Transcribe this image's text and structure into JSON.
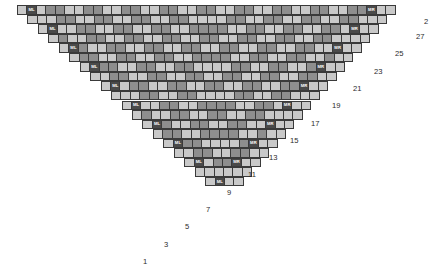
{
  "document": {
    "title": "Triangular Shawl Knitting Chart",
    "type": "grid-chart"
  },
  "legend": {
    "marker_left_label": "ML",
    "marker_right_label": "MR",
    "light_color": "#c9c9c9",
    "dark_color": "#8e8e8e",
    "marker_color": "#4a4a4a",
    "grid_line_color": "#3a3a3a",
    "text_color": "#2b2b2b"
  },
  "grid": {
    "cell_width": 10.45,
    "cell_height": 9.55,
    "rows_count": 28,
    "origin_x": 17,
    "origin_y": 5,
    "top_row_cells": 40
  },
  "row_numbers": [
    {
      "label": "2",
      "x": 418,
      "y": 53
    },
    {
      "label": "27",
      "x": 393,
      "y": 72
    },
    {
      "label": "25",
      "x": 372,
      "y": 91
    },
    {
      "label": "23",
      "x": 351,
      "y": 110
    },
    {
      "label": "21",
      "x": 330,
      "y": 129
    },
    {
      "label": "19",
      "x": 309,
      "y": 148
    },
    {
      "label": "17",
      "x": 288,
      "y": 167
    },
    {
      "label": "15",
      "x": 267,
      "y": 186
    },
    {
      "label": "13",
      "x": 246,
      "y": 205
    },
    {
      "label": "11",
      "x": 225,
      "y": 224
    },
    {
      "label": "9",
      "x": 207,
      "y": 243
    },
    {
      "label": "7",
      "x": 186,
      "y": 262
    },
    {
      "label": "5",
      "x": 165,
      "y": 281
    },
    {
      "label": "3",
      "x": 144,
      "y": 300
    },
    {
      "label": "1",
      "x": 123,
      "y": 319
    }
  ],
  "chart_data": {
    "type": "heatmap",
    "xlabel": "",
    "ylabel": "Row",
    "legend": [
      "light stitch",
      "dark stitch",
      "ML increase marker",
      "MR increase marker"
    ],
    "row_labels_right": [
      "2",
      "27",
      "25",
      "23",
      "21",
      "19",
      "17",
      "15",
      "13",
      "11",
      "9",
      "7",
      "5",
      "3",
      "1"
    ],
    "rows": [
      {
        "index": 0,
        "left": 17,
        "top": 5,
        "cells": "LMddLdLdddLdLdLdLdLdddLdLdLdLdLdLddRLL"
      },
      {
        "index": 1,
        "left": 27,
        "top": 14,
        "cells": "LLdLdLdddLdLdLdLdLdLdLdLdLdLdLdLdLL"
      },
      {
        "index": 2,
        "left": 38,
        "top": 24,
        "cells": "LMdLdLdddLdLdLdLdLdLdLdLdLdLdLdRLL"
      },
      {
        "index": 3,
        "left": 48,
        "top": 33,
        "cells": "LLdLdLdddLdLdLdLdLdLdLdLdLdLdLL"
      },
      {
        "index": 4,
        "left": 59,
        "top": 43,
        "cells": "LMdLdLdddLdLdLdLdLdLdLdLdLdRLL"
      },
      {
        "index": 5,
        "left": 69,
        "top": 52,
        "cells": "LLdLdLdddLdLdLdLdLdLdLdLdLL"
      },
      {
        "index": 6,
        "left": 80,
        "top": 62,
        "cells": "LMdLdLdddLdLdLdLdLdLdLdRLL"
      },
      {
        "index": 7,
        "left": 90,
        "top": 71,
        "cells": "LLdLdLdddLdLdLdLdLdLdLL"
      },
      {
        "index": 8,
        "left": 101,
        "top": 81,
        "cells": "LMdLdLdddLdLdLdLdLdRLL"
      },
      {
        "index": 9,
        "left": 111,
        "top": 90,
        "cells": "LLdLdLdddLdLdLdLdLL"
      },
      {
        "index": 10,
        "left": 122,
        "top": 100,
        "cells": "LMdLdLdddLdLdLdRLL"
      },
      {
        "index": 11,
        "left": 132,
        "top": 109,
        "cells": "LLdLdLdddLdLdLL"
      },
      {
        "index": 12,
        "left": 143,
        "top": 119,
        "cells": "LMdLdLdddLdRLL"
      },
      {
        "index": 13,
        "left": 153,
        "top": 128,
        "cells": "LLdLdLdddLL"
      },
      {
        "index": 14,
        "left": 164,
        "top": 138,
        "cells": "LMdLdLdRLL"
      },
      {
        "index": 15,
        "left": 174,
        "top": 147,
        "cells": "LLdLdLL"
      },
      {
        "index": 16,
        "left": 185,
        "top": 157,
        "cells": "LMdRLL"
      },
      {
        "index": 17,
        "left": 195,
        "top": 166,
        "cells": "LLLL"
      }
    ]
  }
}
